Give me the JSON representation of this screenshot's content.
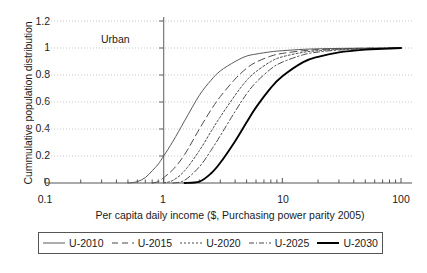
{
  "chart_data": {
    "type": "line",
    "title": "",
    "annotation": "Urban",
    "xlabel": "Per capita daily income ($, Purchasing power parity 2005)",
    "ylabel": "Cummulative population distribution",
    "xscale": "log",
    "xlim": [
      0.1,
      100
    ],
    "ylim": [
      0,
      1.2
    ],
    "xticks": [
      "0.1",
      "1",
      "10",
      "100"
    ],
    "xtick_values": [
      0.1,
      1,
      10,
      100
    ],
    "yticks": [
      "0",
      "0.2",
      "0.4",
      "0.6",
      "0.8",
      "1",
      "1.2"
    ],
    "ytick_values": [
      0,
      0.2,
      0.4,
      0.6,
      0.8,
      1,
      1.2
    ],
    "grid": "horizontal-dotted",
    "legend_position": "below-plot",
    "x": [
      0.1,
      0.15,
      0.2,
      0.3,
      0.4,
      0.5,
      0.6,
      0.7,
      0.8,
      0.9,
      1.0,
      1.2,
      1.5,
      2.0,
      2.5,
      3.0,
      4.0,
      5.0,
      6.0,
      8.0,
      10.0,
      15.0,
      20.0,
      30.0,
      50.0,
      70.0,
      100.0
    ],
    "series": [
      {
        "name": "U-2010",
        "style": "solid-thin",
        "color": "#5a5a5a",
        "values": [
          0.0,
          0.0,
          0.0,
          0.0,
          0.0,
          0.0,
          0.01,
          0.04,
          0.09,
          0.14,
          0.2,
          0.31,
          0.46,
          0.65,
          0.76,
          0.83,
          0.9,
          0.94,
          0.955,
          0.972,
          0.98,
          0.99,
          0.994,
          0.997,
          0.999,
          1.0,
          1.0
        ]
      },
      {
        "name": "U-2015",
        "style": "dashed",
        "color": "#4a4a4a",
        "values": [
          0.0,
          0.0,
          0.0,
          0.0,
          0.0,
          0.0,
          0.0,
          0.0,
          0.0,
          0.01,
          0.04,
          0.1,
          0.21,
          0.4,
          0.54,
          0.64,
          0.77,
          0.85,
          0.895,
          0.94,
          0.96,
          0.98,
          0.988,
          0.994,
          0.998,
          0.999,
          1.0
        ]
      },
      {
        "name": "U-2020",
        "style": "dotted",
        "color": "#4a4a4a",
        "values": [
          0.0,
          0.0,
          0.0,
          0.0,
          0.0,
          0.0,
          0.0,
          0.0,
          0.0,
          0.0,
          0.0,
          0.02,
          0.09,
          0.24,
          0.38,
          0.49,
          0.65,
          0.76,
          0.825,
          0.9,
          0.935,
          0.968,
          0.98,
          0.99,
          0.996,
          0.998,
          1.0
        ]
      },
      {
        "name": "U-2025",
        "style": "dash-dot",
        "color": "#4a4a4a",
        "values": [
          0.0,
          0.0,
          0.0,
          0.0,
          0.0,
          0.0,
          0.0,
          0.0,
          0.0,
          0.0,
          0.0,
          0.0,
          0.02,
          0.12,
          0.24,
          0.35,
          0.53,
          0.66,
          0.745,
          0.845,
          0.895,
          0.95,
          0.97,
          0.985,
          0.994,
          0.997,
          1.0
        ]
      },
      {
        "name": "U-2030",
        "style": "solid-thick",
        "color": "#000000",
        "values": [
          0.0,
          0.0,
          0.0,
          0.0,
          0.0,
          0.0,
          0.0,
          0.0,
          0.0,
          0.0,
          0.0,
          0.0,
          0.0,
          0.01,
          0.07,
          0.15,
          0.31,
          0.45,
          0.56,
          0.705,
          0.79,
          0.895,
          0.935,
          0.968,
          0.988,
          0.994,
          1.0
        ]
      }
    ]
  },
  "legend": {
    "entries": [
      {
        "label": "U-2010"
      },
      {
        "label": "U-2015"
      },
      {
        "label": "U-2020"
      },
      {
        "label": "U-2025"
      },
      {
        "label": "U-2030"
      }
    ]
  }
}
